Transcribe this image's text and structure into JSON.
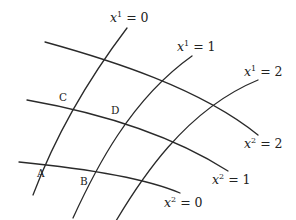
{
  "figure": {
    "stroke_color": "#2a2a2a",
    "x1_curves": [
      {
        "label_var": "x",
        "label_sup": "1",
        "label_rest": " = 0",
        "value": 0
      },
      {
        "label_var": "x",
        "label_sup": "1",
        "label_rest": " = 1",
        "value": 1
      },
      {
        "label_var": "x",
        "label_sup": "1",
        "label_rest": " = 2",
        "value": 2
      }
    ],
    "x2_curves": [
      {
        "label_var": "x",
        "label_sup": "2",
        "label_rest": " = 0",
        "value": 0
      },
      {
        "label_var": "x",
        "label_sup": "2",
        "label_rest": " = 1",
        "value": 1
      },
      {
        "label_var": "x",
        "label_sup": "2",
        "label_rest": " = 2",
        "value": 2
      }
    ],
    "points": [
      {
        "name": "A"
      },
      {
        "name": "B"
      },
      {
        "name": "C"
      },
      {
        "name": "D"
      }
    ]
  }
}
